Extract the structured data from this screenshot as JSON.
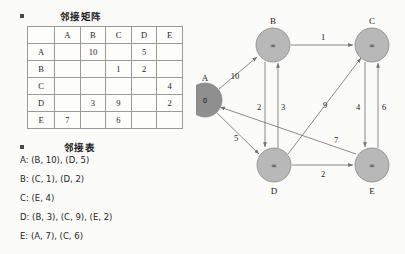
{
  "matrix_section": {
    "title": "邻接矩阵",
    "bullet_icon": "square-bullet-icon",
    "columns": [
      "",
      "A",
      "B",
      "C",
      "D",
      "E"
    ],
    "rows": [
      {
        "label": "A",
        "cells": [
          "",
          "10",
          "",
          "5",
          ""
        ]
      },
      {
        "label": "B",
        "cells": [
          "",
          "",
          "1",
          "2",
          ""
        ]
      },
      {
        "label": "C",
        "cells": [
          "",
          "",
          "",
          "",
          "4"
        ]
      },
      {
        "label": "D",
        "cells": [
          "",
          "3",
          "9",
          "",
          "2"
        ]
      },
      {
        "label": "E",
        "cells": [
          "7",
          "",
          "6",
          "",
          ""
        ]
      }
    ]
  },
  "list_section": {
    "title": "邻接表",
    "bullet_icon": "square-bullet-icon",
    "entries": [
      "A: (B, 10), (D, 5)",
      "B: (C, 1), (D, 2)",
      "C: (E, 4)",
      "D: (B, 3), (C, 9), (E, 2)",
      "E: (A, 7), (C, 6)"
    ]
  },
  "graph": {
    "node_fill": "#b8b8b8",
    "source_fill": "#8f8f8f",
    "nodes": [
      {
        "id": "A",
        "label": "A",
        "value": "0",
        "cx": 9,
        "cy": 100,
        "r": 17,
        "label_dx": 0,
        "label_dy": -19,
        "source": true
      },
      {
        "id": "B",
        "label": "B",
        "value": "∞",
        "cx": 77,
        "cy": 45,
        "r": 17,
        "label_dx": 0,
        "label_dy": -21,
        "source": false
      },
      {
        "id": "C",
        "label": "C",
        "value": "∞",
        "cx": 176,
        "cy": 45,
        "r": 17,
        "label_dx": 0,
        "label_dy": -21,
        "source": false
      },
      {
        "id": "D",
        "label": "D",
        "value": "∞",
        "cx": 78,
        "cy": 165,
        "r": 17,
        "label_dx": 0,
        "label_dy": 29,
        "source": false
      },
      {
        "id": "E",
        "label": "E",
        "value": "∞",
        "cx": 176,
        "cy": 165,
        "r": 17,
        "label_dx": 0,
        "label_dy": 29,
        "source": false
      }
    ],
    "edges": [
      {
        "from": "A",
        "to": "B",
        "weight": "10",
        "lx": 39,
        "ly": 76
      },
      {
        "from": "B",
        "to": "C",
        "weight": "1",
        "lx": 127,
        "ly": 40
      },
      {
        "from": "A",
        "to": "D",
        "weight": "5",
        "lx": 40,
        "ly": 138
      },
      {
        "from": "B",
        "to": "D",
        "weight": "2",
        "lx": 63,
        "ly": 107
      },
      {
        "from": "D",
        "to": "B",
        "weight": "3",
        "lx": 85,
        "ly": 107
      },
      {
        "from": "D",
        "to": "C",
        "weight": "9",
        "lx": 129,
        "ly": 105
      },
      {
        "from": "C",
        "to": "E",
        "weight": "4",
        "lx": 161,
        "ly": 107
      },
      {
        "from": "E",
        "to": "C",
        "weight": "6",
        "lx": 186,
        "ly": 107
      },
      {
        "from": "E",
        "to": "A",
        "weight": "7",
        "lx": 138,
        "ly": 140
      },
      {
        "from": "D",
        "to": "E",
        "weight": "2",
        "lx": 127,
        "ly": 174
      }
    ]
  }
}
